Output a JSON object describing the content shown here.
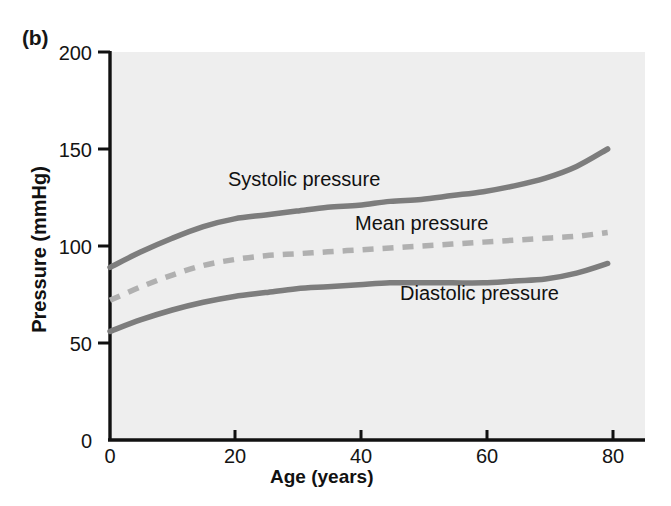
{
  "figure": {
    "panel_label": "(b)",
    "background_color": "#ffffff",
    "plot_background_color": "#eeeeee",
    "axis_color": "#111111"
  },
  "chart_data": {
    "type": "line",
    "title": "",
    "panel": "(b)",
    "xlabel": "Age (years)",
    "ylabel": "Pressure (mmHg)",
    "xlim": [
      0,
      86
    ],
    "ylim": [
      0,
      200
    ],
    "xticks": [
      0,
      20,
      40,
      60,
      80
    ],
    "xtick_labels": [
      "0",
      "20",
      "40",
      "60",
      "80"
    ],
    "yticks": [
      0,
      50,
      100,
      150,
      200
    ],
    "ytick_labels": [
      "0",
      "50",
      "100",
      "150",
      "200"
    ],
    "grid": false,
    "legend_position": "inline-annotations",
    "x": [
      0,
      5,
      10,
      15,
      20,
      25,
      30,
      35,
      40,
      45,
      50,
      55,
      60,
      65,
      70,
      75,
      80
    ],
    "series": [
      {
        "name": "Systolic pressure",
        "label": "Systolic pressure",
        "color": "#7d7d7d",
        "style": "solid",
        "values": [
          89,
          97,
          104,
          110,
          114,
          116,
          118,
          120,
          121,
          123,
          124,
          126,
          128,
          131,
          135,
          141,
          150
        ]
      },
      {
        "name": "Mean pressure",
        "label": "Mean pressure",
        "color": "#b0b0b0",
        "style": "dashed",
        "values": [
          72,
          79,
          85,
          90,
          93,
          95,
          96,
          97,
          98,
          99,
          100,
          101,
          102,
          103,
          104,
          105,
          107
        ]
      },
      {
        "name": "Diastolic pressure",
        "label": "Diastolic pressure",
        "color": "#7d7d7d",
        "style": "solid",
        "values": [
          56,
          62,
          67,
          71,
          74,
          76,
          78,
          79,
          80,
          81,
          81,
          81,
          81,
          82,
          83,
          86,
          91
        ]
      }
    ],
    "annotations": [
      {
        "text": "Systolic pressure",
        "x": 28,
        "y": 133
      },
      {
        "text": "Mean pressure",
        "x": 48,
        "y": 115
      },
      {
        "text": "Diastolic pressure",
        "x": 60,
        "y": 66
      }
    ]
  }
}
